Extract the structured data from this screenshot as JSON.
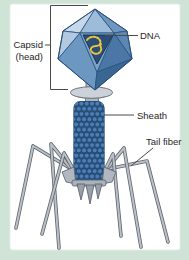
{
  "diagram": {
    "labels": {
      "capsid_line1": "Capsid",
      "capsid_line2": "(head)",
      "dna": "DNA",
      "sheath": "Sheath",
      "tail_fiber": "Tail fiber"
    },
    "colors": {
      "background": "#cfe4d7",
      "panel": "#ffffff",
      "capsid_light": "#c7d8e9",
      "capsid_mid": "#7ca2c8",
      "capsid_dark": "#44719f",
      "dna_window": "#2a4e78",
      "dna_strand": "#eac43f",
      "sheath_bead": "#4d7fb4",
      "sheath_core": "#2b5381",
      "metal_light": "#ccd2da",
      "metal_mid": "#b0b7c0",
      "metal_dark": "#5f656d",
      "outline": "#27507b",
      "leader_line": "#4a4a4a",
      "label_text": "#1f1f1f"
    }
  }
}
